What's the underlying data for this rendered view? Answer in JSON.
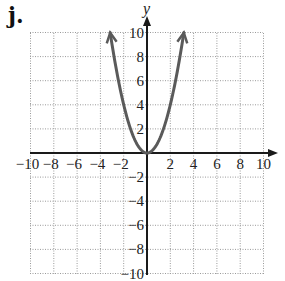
{
  "panel_label": "j.",
  "chart_data": {
    "type": "line",
    "title": "",
    "xlabel": "",
    "ylabel": "y",
    "xlim": [
      -10,
      10
    ],
    "ylim": [
      -10,
      10
    ],
    "grid": true,
    "grid_style": "dotted",
    "grid_step": 2,
    "x_ticks": [
      "-10",
      "-8",
      "-6",
      "-4",
      "-2",
      "2",
      "4",
      "6",
      "8",
      "10"
    ],
    "y_ticks": [
      "10",
      "8",
      "6",
      "4",
      "2",
      "-2",
      "-4",
      "-6",
      "-8",
      "-10"
    ],
    "series": [
      {
        "name": "y = x^2",
        "equation": "y = x^2",
        "x_range": [
          -3.16,
          3.16
        ],
        "arrows_at_ends": true,
        "points": [
          [
            -3.16,
            10
          ],
          [
            -3,
            9
          ],
          [
            -2,
            4
          ],
          [
            -1,
            1
          ],
          [
            0,
            0
          ],
          [
            1,
            1
          ],
          [
            2,
            4
          ],
          [
            3,
            9
          ],
          [
            3.16,
            10
          ]
        ]
      }
    ],
    "colors": {
      "curve": "#5a5a5a",
      "axis": "#1a1a1a",
      "grid": "#9a9a9a"
    }
  }
}
